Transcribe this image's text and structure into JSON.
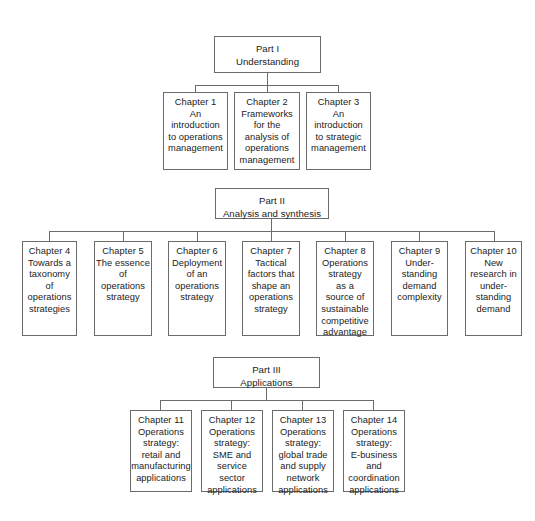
{
  "diagram": {
    "parts": [
      {
        "id": "part-1",
        "label": "Part I\nUnderstanding",
        "chapters": [
          {
            "id": "chapter-1",
            "label": "Chapter 1\nAn\nintroduction\nto operations\nmanagement"
          },
          {
            "id": "chapter-2",
            "label": "Chapter 2\nFrameworks\nfor the\nanalysis of\noperations\nmanagement"
          },
          {
            "id": "chapter-3",
            "label": "Chapter 3\nAn\nintroduction\nto strategic\nmanagement"
          }
        ]
      },
      {
        "id": "part-2",
        "label": "Part II\nAnalysis and synthesis",
        "chapters": [
          {
            "id": "chapter-4",
            "label": "Chapter 4\nTowards a\ntaxonomy\nof\noperations\nstrategies"
          },
          {
            "id": "chapter-5",
            "label": "Chapter 5\nThe essence\nof\noperations\nstrategy"
          },
          {
            "id": "chapter-6",
            "label": "Chapter 6\nDeployment\nof an\noperations\nstrategy"
          },
          {
            "id": "chapter-7",
            "label": "Chapter 7\nTactical\nfactors that\nshape an\noperations\nstrategy"
          },
          {
            "id": "chapter-8",
            "label": "Chapter 8\nOperations\nstrategy\nas a\nsource of\nsustainable\ncompetitive\nadvantage"
          },
          {
            "id": "chapter-9",
            "label": "Chapter 9\nUnder-\nstanding\ndemand\ncomplexity"
          },
          {
            "id": "chapter-10",
            "label": "Chapter 10\nNew\nresearch in\nunder-\nstanding\ndemand"
          }
        ]
      },
      {
        "id": "part-3",
        "label": "Part III\nApplications",
        "chapters": [
          {
            "id": "chapter-11",
            "label": "Chapter 11\nOperations\nstrategy:\nretail and\nmanufacturing\napplications"
          },
          {
            "id": "chapter-12",
            "label": "Chapter 12\nOperations\nstrategy:\nSME and\nservice\nsector\napplications"
          },
          {
            "id": "chapter-13",
            "label": "Chapter 13\nOperations\nstrategy:\nglobal trade\nand supply\nnetwork\napplications"
          },
          {
            "id": "chapter-14",
            "label": "Chapter 14\nOperations\nstrategy:\nE-business\nand\ncoordination\napplications"
          }
        ]
      }
    ],
    "colors": {
      "border": "#6b6b6b",
      "background": "#ffffff",
      "text": "#1b1b1b"
    }
  }
}
